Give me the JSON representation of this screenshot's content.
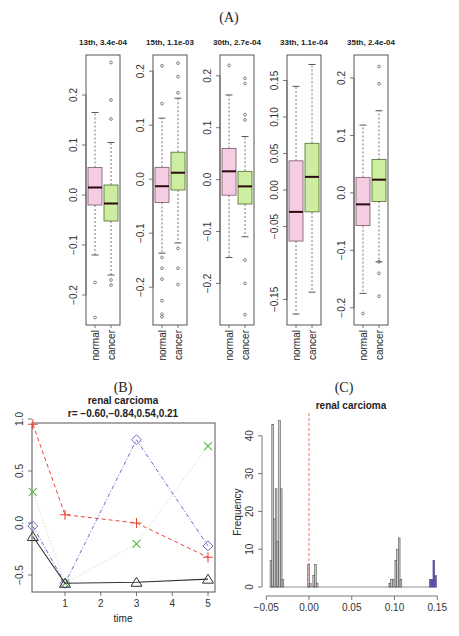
{
  "figure": {
    "panel_labels": [
      "(A)",
      "(B)",
      "(C)"
    ]
  },
  "colors": {
    "normal_fill": "#f5cde3",
    "cancer_fill": "#cdeea0",
    "median": "#2a0a10",
    "frame": "#555555",
    "red_line": "#ee4433",
    "green_line": "#55bb44",
    "blue_line": "#6a6acc",
    "black_line": "#333333",
    "hist_bar": "#cccccc",
    "hist_highlight": "#6655aa",
    "vline": "#ee6655"
  },
  "chart_data": [
    {
      "type": "box",
      "panel": "A",
      "title": "13th, 3.4e-04",
      "categories": [
        "normal",
        "cancer"
      ],
      "ylim": [
        -0.26,
        0.28
      ],
      "yticks": [
        -0.2,
        -0.1,
        0.0,
        0.1,
        0.2
      ],
      "ytick_labels": [
        "-0.2",
        "-0.1",
        "0.0",
        "0.1",
        "0.2"
      ],
      "boxes": [
        {
          "name": "normal",
          "whisker_low": -0.12,
          "q1": -0.02,
          "median": 0.015,
          "q3": 0.055,
          "whisker_high": 0.165,
          "outliers": [
            -0.175,
            -0.245
          ]
        },
        {
          "name": "cancer",
          "whisker_low": -0.16,
          "q1": -0.052,
          "median": -0.017,
          "q3": 0.02,
          "whisker_high": 0.105,
          "outliers": [
            0.265,
            0.19,
            0.152,
            -0.17,
            -0.18
          ]
        }
      ]
    },
    {
      "type": "box",
      "panel": "A",
      "title": "15th, 1.1e-03",
      "categories": [
        "normal",
        "cancer"
      ],
      "ylim": [
        -0.27,
        0.23
      ],
      "yticks": [
        -0.2,
        -0.1,
        0.0,
        0.1,
        0.2
      ],
      "ytick_labels": [
        "-0.2",
        "-0.1",
        "0.0",
        "0.1",
        "0.2"
      ],
      "boxes": [
        {
          "name": "normal",
          "whisker_low": -0.137,
          "q1": -0.043,
          "median": -0.013,
          "q3": 0.022,
          "whisker_high": 0.113,
          "outliers": [
            0.21,
            0.14,
            -0.145,
            -0.165,
            -0.185,
            -0.225,
            -0.25,
            -0.255
          ]
        },
        {
          "name": "cancer",
          "whisker_low": -0.118,
          "q1": -0.02,
          "median": 0.012,
          "q3": 0.05,
          "whisker_high": 0.15,
          "outliers": [
            0.215,
            0.19,
            0.16,
            -0.128,
            -0.165,
            -0.195
          ]
        }
      ]
    },
    {
      "type": "box",
      "panel": "A",
      "title": "30th, 2.7e-04",
      "categories": [
        "normal",
        "cancer"
      ],
      "ylim": [
        -0.28,
        0.24
      ],
      "yticks": [
        -0.2,
        -0.1,
        0.0,
        0.1,
        0.2
      ],
      "ytick_labels": [
        "-0.2",
        "-0.1",
        "0.0",
        "0.1",
        "0.2"
      ],
      "boxes": [
        {
          "name": "normal",
          "whisker_low": -0.15,
          "q1": -0.03,
          "median": 0.016,
          "q3": 0.06,
          "whisker_high": 0.163,
          "outliers": [
            0.22
          ]
        },
        {
          "name": "cancer",
          "whisker_low": -0.11,
          "q1": -0.047,
          "median": -0.013,
          "q3": 0.016,
          "whisker_high": 0.083,
          "outliers": [
            0.195,
            0.185,
            0.125,
            0.115,
            -0.155,
            -0.2,
            -0.26
          ]
        }
      ]
    },
    {
      "type": "box",
      "panel": "A",
      "title": "33th, 1.1e-04",
      "categories": [
        "normal",
        "cancer"
      ],
      "ylim": [
        -0.185,
        0.185
      ],
      "yticks": [
        -0.15,
        -0.05,
        0.0,
        0.05,
        0.1,
        0.15
      ],
      "ytick_labels": [
        "-0.15",
        "-0.05",
        "0.00",
        "0.05",
        "0.10",
        "0.15"
      ],
      "boxes": [
        {
          "name": "normal",
          "whisker_low": -0.17,
          "q1": -0.07,
          "median": -0.03,
          "q3": 0.04,
          "whisker_high": 0.142,
          "outliers": []
        },
        {
          "name": "cancer",
          "whisker_low": -0.14,
          "q1": -0.03,
          "median": 0.018,
          "q3": 0.064,
          "whisker_high": 0.172,
          "outliers": []
        }
      ]
    },
    {
      "type": "box",
      "panel": "A",
      "title": "35th, 2.4e-04",
      "categories": [
        "normal",
        "cancer"
      ],
      "ylim": [
        -0.23,
        0.24
      ],
      "yticks": [
        -0.2,
        -0.1,
        0.0,
        0.1,
        0.2
      ],
      "ytick_labels": [
        "-0.2",
        "-0.1",
        "0.0",
        "0.1",
        "0.2"
      ],
      "boxes": [
        {
          "name": "normal",
          "whisker_low": -0.175,
          "q1": -0.057,
          "median": -0.02,
          "q3": 0.027,
          "whisker_high": 0.118,
          "outliers": [
            -0.21
          ]
        },
        {
          "name": "cancer",
          "whisker_low": -0.12,
          "q1": -0.015,
          "median": 0.023,
          "q3": 0.058,
          "whisker_high": 0.143,
          "outliers": [
            0.22,
            0.19,
            -0.12,
            -0.14,
            -0.18
          ]
        }
      ]
    },
    {
      "type": "line",
      "panel": "B",
      "title": "renal carcioma",
      "subtitle": "r= -0.60,-0.84,0.54,0.21",
      "xlabel": "time",
      "ylabel": "",
      "x": [
        0.1,
        1,
        3,
        5
      ],
      "xlim": [
        0,
        5.2
      ],
      "ylim": [
        -0.62,
        1.0
      ],
      "xticks": [
        1,
        2,
        3,
        4,
        5
      ],
      "yticks": [
        -0.5,
        0.0,
        0.5,
        1.0
      ],
      "ytick_labels": [
        "-0.5",
        "0.0",
        "0.5",
        "1.0"
      ],
      "series": [
        {
          "name": "plus",
          "marker": "+",
          "style": "dashed",
          "color": "#ee4433",
          "values": [
            0.95,
            0.08,
            0.0,
            -0.33
          ]
        },
        {
          "name": "cross",
          "marker": "x",
          "style": "dotted",
          "color": "#55bb44",
          "values": [
            0.3,
            -0.58,
            -0.2,
            0.74
          ]
        },
        {
          "name": "diamond",
          "marker": "diamond",
          "style": "dashdot",
          "color": "#6a6acc",
          "values": [
            -0.03,
            -0.58,
            0.8,
            -0.22
          ]
        },
        {
          "name": "triangle",
          "marker": "triangle",
          "style": "solid",
          "color": "#333333",
          "values": [
            -0.13,
            -0.58,
            -0.57,
            -0.54
          ]
        }
      ]
    },
    {
      "type": "histogram",
      "panel": "C",
      "title": "renal carcioma",
      "xlabel": "",
      "ylabel": "Frequency",
      "xlim": [
        -0.05,
        0.15
      ],
      "ylim": [
        0,
        44
      ],
      "xticks": [
        -0.05,
        0.0,
        0.05,
        0.1,
        0.15
      ],
      "xtick_labels": [
        "-0.05",
        "0.00",
        "0.05",
        "0.10",
        "0.15"
      ],
      "yticks": [
        0,
        10,
        20,
        30,
        40
      ],
      "vline_x": 0.0,
      "bins": [
        {
          "x0": -0.0455,
          "x1": -0.0435,
          "count": 7
        },
        {
          "x0": -0.0435,
          "x1": -0.0415,
          "count": 43
        },
        {
          "x0": -0.0415,
          "x1": -0.0395,
          "count": 18
        },
        {
          "x0": -0.0395,
          "x1": -0.0375,
          "count": 26
        },
        {
          "x0": -0.0375,
          "x1": -0.0355,
          "count": 12
        },
        {
          "x0": -0.0355,
          "x1": -0.0335,
          "count": 44
        },
        {
          "x0": -0.0335,
          "x1": -0.0315,
          "count": 26
        },
        {
          "x0": -0.0315,
          "x1": -0.0295,
          "count": 2
        },
        {
          "x0": -0.0015,
          "x1": 0.0005,
          "count": 6
        },
        {
          "x0": 0.0005,
          "x1": 0.0025,
          "count": 1
        },
        {
          "x0": 0.0045,
          "x1": 0.0065,
          "count": 3
        },
        {
          "x0": 0.0065,
          "x1": 0.0085,
          "count": 6
        },
        {
          "x0": 0.0085,
          "x1": 0.0105,
          "count": 1
        },
        {
          "x0": 0.0935,
          "x1": 0.0955,
          "count": 1
        },
        {
          "x0": 0.0955,
          "x1": 0.0975,
          "count": 2
        },
        {
          "x0": 0.0975,
          "x1": 0.0995,
          "count": 2
        },
        {
          "x0": 0.1005,
          "x1": 0.1025,
          "count": 7
        },
        {
          "x0": 0.1025,
          "x1": 0.1045,
          "count": 10
        },
        {
          "x0": 0.1045,
          "x1": 0.1065,
          "count": 13
        },
        {
          "x0": 0.1065,
          "x1": 0.1085,
          "count": 2
        },
        {
          "x0": 0.141,
          "x1": 0.143,
          "count": 2,
          "highlight": true
        },
        {
          "x0": 0.143,
          "x1": 0.145,
          "count": 2,
          "highlight": true
        },
        {
          "x0": 0.145,
          "x1": 0.147,
          "count": 7,
          "highlight": true
        },
        {
          "x0": 0.147,
          "x1": 0.149,
          "count": 3,
          "highlight": true
        }
      ]
    }
  ]
}
